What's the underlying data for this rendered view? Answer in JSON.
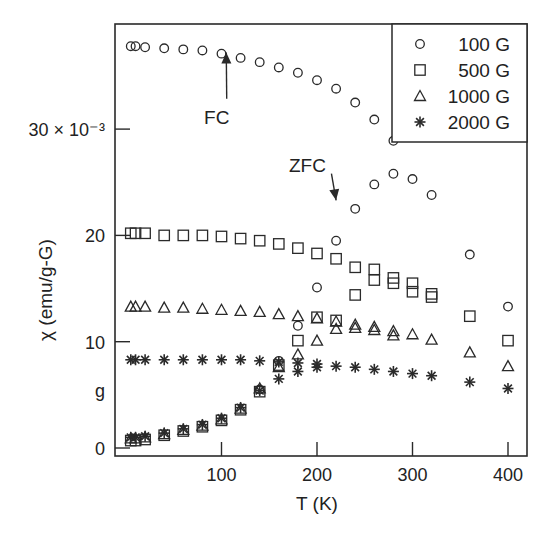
{
  "chart_data": {
    "type": "scatter",
    "title": "",
    "xlabel": "T (K)",
    "ylabel": "χ (emu/g-G)",
    "y_tick_labels": [
      "0",
      "g",
      "10",
      "20",
      "30 × 10⁻³"
    ],
    "x_ticks": [
      100,
      200,
      300,
      400
    ],
    "y_ticks": [
      0,
      10,
      20,
      30
    ],
    "xlim": [
      -11,
      422
    ],
    "ylim": [
      -0.3,
      40
    ],
    "grid": false,
    "legend_position": "upper right",
    "annotations": [
      {
        "text": "FC",
        "x": 95,
        "y": 30.5,
        "arrow_to": [
          105,
          37.2
        ]
      },
      {
        "text": "ZFC",
        "x": 190,
        "y": 26,
        "arrow_to": [
          220,
          23.3
        ]
      }
    ],
    "series": [
      {
        "name": "100 G",
        "marker": "circle",
        "curve": "FC",
        "x": [
          5,
          10,
          20,
          40,
          60,
          80,
          100,
          120,
          140,
          160,
          180,
          200,
          220,
          240,
          260,
          280
        ],
        "y": [
          37.8,
          37.8,
          37.7,
          37.6,
          37.5,
          37.4,
          37.1,
          36.7,
          36.3,
          35.8,
          35.3,
          34.6,
          33.8,
          32.5,
          30.9,
          28.9
        ]
      },
      {
        "name": "100 G",
        "marker": "circle",
        "curve": "ZFC",
        "x": [
          140,
          160,
          180,
          200,
          220,
          240,
          260,
          280,
          300,
          320,
          360,
          400
        ],
        "y": [
          5.5,
          8.2,
          11.5,
          15.1,
          19.5,
          22.5,
          24.8,
          25.8,
          25.3,
          23.8,
          18.2,
          13.3
        ]
      },
      {
        "name": "500 G",
        "marker": "square",
        "curve": "FC",
        "x": [
          5,
          10,
          20,
          40,
          60,
          80,
          100,
          120,
          140,
          160,
          180,
          200,
          220,
          240,
          260,
          280,
          300,
          320
        ],
        "y": [
          20.2,
          20.2,
          20.2,
          20.0,
          20.0,
          20.0,
          19.9,
          19.7,
          19.5,
          19.2,
          18.8,
          18.3,
          17.8,
          17.0,
          16.8,
          16.0,
          15.5,
          14.5
        ]
      },
      {
        "name": "500 G",
        "marker": "square",
        "curve": "ZFC",
        "x": [
          5,
          10,
          20,
          40,
          60,
          80,
          100,
          120,
          140,
          160,
          180,
          200,
          220,
          240,
          260,
          280,
          300,
          320,
          360,
          400
        ],
        "y": [
          0.7,
          0.7,
          0.8,
          1.2,
          1.6,
          2.0,
          2.6,
          3.6,
          5.3,
          7.8,
          10.1,
          12.3,
          12.0,
          14.4,
          15.8,
          15.5,
          14.7,
          14.2,
          12.4,
          10.1
        ]
      },
      {
        "name": "1000 G",
        "marker": "triangle",
        "curve": "FC",
        "x": [
          5,
          10,
          20,
          40,
          60,
          80,
          100,
          120,
          140,
          160,
          180,
          200,
          220,
          240,
          260,
          280,
          300,
          320
        ],
        "y": [
          13.3,
          13.3,
          13.3,
          13.2,
          13.2,
          13.1,
          13.0,
          12.9,
          12.8,
          12.6,
          12.4,
          12.2,
          11.9,
          11.6,
          11.4,
          11.0,
          10.7,
          10.2
        ]
      },
      {
        "name": "1000 G",
        "marker": "triangle",
        "curve": "ZFC",
        "x": [
          5,
          10,
          20,
          40,
          60,
          80,
          100,
          120,
          140,
          160,
          180,
          200,
          220,
          240,
          260,
          280,
          360,
          400
        ],
        "y": [
          0.9,
          0.9,
          1.0,
          1.3,
          1.7,
          2.1,
          2.7,
          3.7,
          5.6,
          7.6,
          8.8,
          10.1,
          11.2,
          11.3,
          11.1,
          10.6,
          9.0,
          7.7
        ]
      },
      {
        "name": "2000 G",
        "marker": "asterisk",
        "curve": "FC",
        "x": [
          5,
          10,
          20,
          40,
          60,
          80,
          100,
          120,
          140,
          160,
          180,
          200,
          220,
          240,
          260,
          280,
          300,
          320,
          360,
          400
        ],
        "y": [
          8.3,
          8.3,
          8.3,
          8.3,
          8.3,
          8.3,
          8.3,
          8.3,
          8.2,
          8.1,
          8.0,
          7.9,
          7.7,
          7.6,
          7.4,
          7.2,
          7.0,
          6.8,
          6.2,
          5.6
        ]
      },
      {
        "name": "2000 G",
        "marker": "asterisk",
        "curve": "ZFC",
        "x": [
          5,
          10,
          20,
          40,
          60,
          80,
          100,
          120,
          140,
          160,
          180,
          200
        ],
        "y": [
          1.0,
          1.0,
          1.1,
          1.4,
          1.8,
          2.2,
          2.8,
          3.8,
          5.4,
          6.5,
          7.2,
          7.6
        ]
      }
    ]
  },
  "legend": {
    "items": [
      {
        "marker": "circle",
        "label": "100 G"
      },
      {
        "marker": "square",
        "label": "500 G"
      },
      {
        "marker": "triangle",
        "label": "1000 G"
      },
      {
        "marker": "asterisk",
        "label": "2000 G"
      }
    ]
  },
  "colors": {
    "ink": "#2a2a2a",
    "background": "#ffffff"
  }
}
